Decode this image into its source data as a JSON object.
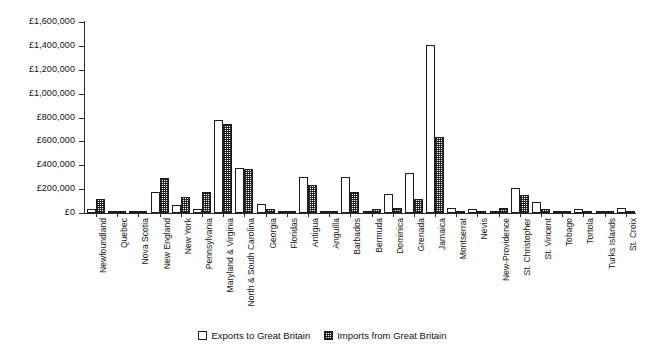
{
  "chart_data": {
    "type": "bar",
    "title": "",
    "subtitle": "",
    "xlabel": "",
    "ylabel": "",
    "ylim": [
      0,
      1600000
    ],
    "ytick_step": 200000,
    "currency_symbol": "£",
    "grid": false,
    "legend_position": "bottom-center",
    "ytick_labels": [
      "£1,600,000",
      "£1,400,000",
      "£1,200,000",
      "£1,000,000",
      "£800,000",
      "£600,000",
      "£400,000",
      "£200,000",
      "£0"
    ],
    "ytick_values": [
      1600000,
      1400000,
      1200000,
      1000000,
      800000,
      600000,
      400000,
      200000,
      0
    ],
    "categories": [
      "Newfoundland",
      "Quebec",
      "Nova Scotia",
      "New England",
      "New York",
      "Pennsylvania",
      "Maryland & Virginia",
      "North & South Carolina",
      "Georgia",
      "Floridas",
      "Antigua",
      "Anguilla",
      "Barbados",
      "Bermuda",
      "Dominica",
      "Grenada",
      "Jamaica",
      "Montserrat",
      "Nevis",
      "New-Providence",
      "St. Christopher",
      "St. Vincent",
      "Tobago",
      "Tortola",
      "Turks Islands",
      "St. Croix"
    ],
    "series": [
      {
        "name": "Exports to Great Britain",
        "values": [
          32000,
          10000,
          10000,
          175000,
          70000,
          30000,
          780000,
          375000,
          75000,
          8000,
          300000,
          8000,
          300000,
          8000,
          160000,
          335000,
          1405000,
          40000,
          30000,
          10000,
          210000,
          95000,
          20000,
          30000,
          12000,
          40000
        ]
      },
      {
        "name": "Imports from Great Britain",
        "values": [
          120000,
          20000,
          20000,
          293000,
          130000,
          180000,
          745000,
          370000,
          30000,
          8000,
          235000,
          6000,
          180000,
          30000,
          40000,
          120000,
          636000,
          15000,
          10000,
          45000,
          150000,
          30000,
          5000,
          8000,
          5000,
          8000
        ]
      }
    ],
    "legend": [
      {
        "label": "Exports to Great Britain",
        "swatch": "open-white-box"
      },
      {
        "label": "Imports from Great Britain",
        "swatch": "hatched-box"
      }
    ]
  }
}
